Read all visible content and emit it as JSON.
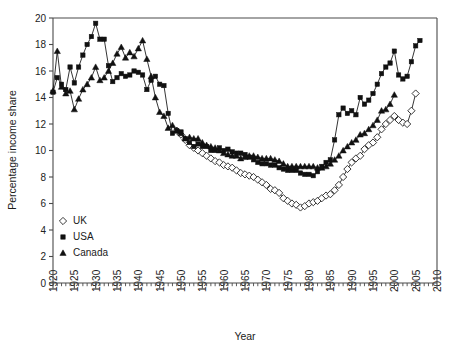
{
  "chart_data": {
    "type": "line",
    "title": "",
    "xlabel": "Year",
    "ylabel": "Percentage income share",
    "xlim": [
      1920,
      2010
    ],
    "ylim": [
      0,
      20
    ],
    "xticks": [
      1920,
      1925,
      1930,
      1935,
      1940,
      1945,
      1950,
      1955,
      1960,
      1965,
      1970,
      1975,
      1980,
      1985,
      1990,
      1995,
      2000,
      2005,
      2010
    ],
    "yticks": [
      0,
      2,
      4,
      6,
      8,
      10,
      12,
      14,
      16,
      18,
      20
    ],
    "xtick_minor_step": 1,
    "grid": false,
    "legend_position": "lower-left-inside",
    "series": [
      {
        "name": "UK",
        "marker": "open-diamond",
        "x": [
          1949,
          1950,
          1951,
          1952,
          1953,
          1954,
          1955,
          1956,
          1957,
          1958,
          1959,
          1960,
          1961,
          1962,
          1963,
          1964,
          1965,
          1966,
          1967,
          1968,
          1969,
          1970,
          1971,
          1972,
          1973,
          1974,
          1975,
          1976,
          1977,
          1978,
          1979,
          1980,
          1981,
          1982,
          1983,
          1984,
          1985,
          1986,
          1987,
          1988,
          1989,
          1990,
          1991,
          1992,
          1993,
          1994,
          1995,
          1996,
          1997,
          1998,
          1999,
          2000,
          2001,
          2002,
          2003,
          2004,
          2005
        ],
        "values": [
          11.5,
          11.2,
          10.8,
          10.4,
          10.2,
          10.0,
          9.8,
          9.6,
          9.4,
          9.2,
          9.1,
          8.9,
          8.8,
          8.7,
          8.5,
          8.3,
          8.2,
          8.1,
          8.0,
          7.8,
          7.6,
          7.4,
          7.1,
          7.0,
          6.8,
          6.4,
          6.2,
          6.0,
          5.9,
          5.7,
          5.8,
          6.0,
          6.1,
          6.2,
          6.4,
          6.6,
          6.7,
          7.0,
          7.4,
          8.0,
          8.6,
          9.1,
          9.4,
          9.6,
          10.1,
          10.4,
          10.6,
          11.0,
          11.6,
          12.0,
          12.3,
          12.6,
          12.3,
          12.1,
          12.0,
          13.0,
          14.3
        ]
      },
      {
        "name": "USA",
        "marker": "filled-square",
        "x": [
          1920,
          1921,
          1922,
          1923,
          1924,
          1925,
          1926,
          1927,
          1928,
          1929,
          1930,
          1931,
          1932,
          1933,
          1934,
          1935,
          1936,
          1937,
          1938,
          1939,
          1940,
          1941,
          1942,
          1943,
          1944,
          1945,
          1946,
          1947,
          1948,
          1949,
          1950,
          1951,
          1952,
          1953,
          1954,
          1955,
          1956,
          1957,
          1958,
          1959,
          1960,
          1961,
          1962,
          1963,
          1964,
          1965,
          1966,
          1967,
          1968,
          1969,
          1970,
          1971,
          1972,
          1973,
          1974,
          1975,
          1976,
          1977,
          1978,
          1979,
          1980,
          1981,
          1982,
          1983,
          1984,
          1985,
          1986,
          1987,
          1988,
          1989,
          1990,
          1991,
          1992,
          1993,
          1994,
          1995,
          1996,
          1997,
          1998,
          1999,
          2000,
          2001,
          2002,
          2003,
          2004,
          2005,
          2006
        ],
        "values": [
          14.4,
          15.5,
          15.0,
          14.6,
          16.3,
          15.1,
          16.3,
          17.2,
          18.0,
          18.6,
          19.6,
          18.4,
          18.4,
          16.4,
          15.2,
          15.5,
          15.8,
          15.6,
          15.7,
          16.0,
          15.9,
          15.7,
          14.6,
          15.3,
          15.6,
          15.0,
          14.9,
          12.8,
          11.3,
          11.5,
          11.4,
          10.9,
          10.6,
          10.3,
          10.5,
          10.3,
          10.3,
          10.0,
          10.0,
          10.2,
          10.0,
          10.1,
          9.9,
          9.8,
          9.8,
          9.7,
          9.5,
          9.3,
          9.1,
          9.0,
          9.0,
          8.9,
          8.9,
          8.7,
          8.6,
          8.5,
          8.5,
          8.5,
          8.3,
          8.2,
          8.2,
          8.1,
          8.4,
          8.8,
          9.1,
          9.3,
          10.8,
          12.7,
          13.2,
          12.8,
          13.0,
          12.7,
          14.0,
          13.5,
          13.8,
          14.3,
          15.0,
          15.8,
          16.3,
          16.6,
          17.5,
          15.7,
          15.4,
          15.6,
          16.7,
          17.9,
          18.3
        ]
      },
      {
        "name": "Canada",
        "marker": "filled-triangle",
        "x": [
          1920,
          1921,
          1922,
          1923,
          1924,
          1925,
          1926,
          1927,
          1928,
          1929,
          1930,
          1931,
          1932,
          1933,
          1934,
          1935,
          1936,
          1937,
          1938,
          1939,
          1940,
          1941,
          1942,
          1943,
          1944,
          1945,
          1946,
          1947,
          1948,
          1949,
          1950,
          1951,
          1952,
          1953,
          1954,
          1955,
          1956,
          1957,
          1958,
          1959,
          1960,
          1961,
          1962,
          1963,
          1964,
          1965,
          1966,
          1967,
          1968,
          1969,
          1970,
          1971,
          1972,
          1973,
          1974,
          1975,
          1976,
          1977,
          1978,
          1979,
          1980,
          1981,
          1982,
          1983,
          1984,
          1985,
          1986,
          1987,
          1988,
          1989,
          1990,
          1991,
          1992,
          1993,
          1994,
          1995,
          1996,
          1997,
          1998,
          1999,
          2000
        ],
        "values": [
          14.5,
          17.5,
          14.8,
          14.3,
          14.5,
          13.1,
          13.9,
          14.6,
          15.0,
          15.5,
          16.3,
          15.3,
          15.5,
          16.0,
          16.6,
          17.3,
          17.8,
          17.0,
          17.4,
          17.1,
          17.7,
          18.3,
          16.9,
          15.6,
          14.0,
          12.9,
          12.6,
          11.7,
          11.9,
          11.5,
          11.3,
          10.9,
          11.0,
          10.9,
          10.9,
          10.6,
          10.4,
          10.3,
          10.2,
          10.0,
          9.8,
          9.7,
          9.6,
          9.6,
          9.4,
          9.5,
          9.6,
          9.6,
          9.5,
          9.4,
          9.4,
          9.4,
          9.3,
          9.2,
          9.0,
          8.8,
          8.8,
          8.8,
          8.8,
          8.8,
          8.8,
          8.8,
          8.7,
          8.7,
          8.8,
          9.0,
          9.3,
          9.6,
          10.0,
          10.3,
          10.6,
          10.8,
          11.2,
          11.3,
          11.6,
          11.9,
          12.3,
          13.0,
          13.1,
          13.5,
          14.2
        ]
      }
    ],
    "legend": [
      {
        "label": "UK",
        "marker": "open-diamond"
      },
      {
        "label": "USA",
        "marker": "filled-square"
      },
      {
        "label": "Canada",
        "marker": "filled-triangle"
      }
    ]
  }
}
